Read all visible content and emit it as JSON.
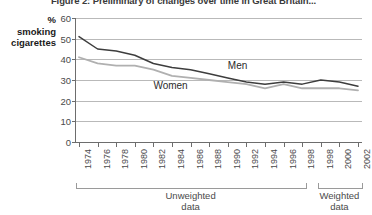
{
  "figure": {
    "title": "Figure 2: Preliminary of changes over time in Great Britain...",
    "axis_caption": {
      "line1": "%",
      "line2": "smoking",
      "line3": "cigarettes"
    }
  },
  "groups": [
    {
      "name": "unweighted-group",
      "line1": "Unweighted",
      "line2": "data"
    },
    {
      "name": "weighted-group",
      "line1": "Weighted",
      "line2": "data"
    }
  ],
  "colors": {
    "men_line": "#3d3d3d",
    "women_line": "#b0b0b0",
    "gridline": "#b9b9b9",
    "axis": "#6d6d6d",
    "text": "#4a4a4a"
  },
  "chart_data": {
    "type": "line",
    "title": "Figure 2: Preliminary of changes over time in Great Britain...",
    "xlabel": "",
    "ylabel": "% smoking cigarettes",
    "ylim": [
      0,
      60
    ],
    "yticks": [
      0,
      10,
      20,
      30,
      40,
      50,
      60
    ],
    "grid": true,
    "legend": "inline-labels",
    "categories": [
      "1974",
      "1976",
      "1978",
      "1980",
      "1982",
      "1984",
      "1986",
      "1988",
      "1990",
      "1992",
      "1994",
      "1996",
      "1998",
      "1998",
      "2000",
      "2002"
    ],
    "series": [
      {
        "name": "Men",
        "color": "#3d3d3d",
        "values": [
          51,
          45,
          44,
          42,
          38,
          36,
          35,
          33,
          31,
          29,
          28,
          29,
          28,
          30,
          29,
          27
        ]
      },
      {
        "name": "Women",
        "color": "#b0b0b0",
        "values": [
          41,
          38,
          37,
          37,
          35,
          32,
          31,
          30,
          29,
          28,
          26,
          28,
          26,
          26,
          26,
          25
        ]
      }
    ],
    "annotations": [
      {
        "text": "Men",
        "x_index": 8,
        "y_value": 37
      },
      {
        "text": "Women",
        "x_index": 4,
        "y_value": 27
      }
    ],
    "group_brackets": [
      {
        "label": "Unweighted data",
        "from_index": 0,
        "to_index": 12
      },
      {
        "label": "Weighted data",
        "from_index": 13,
        "to_index": 15
      }
    ]
  }
}
